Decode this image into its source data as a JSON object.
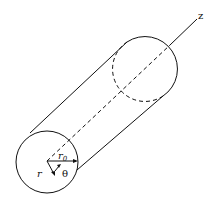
{
  "diagram": {
    "labels": {
      "axis": "z",
      "radius": "r",
      "radius_sub": "0",
      "r_coord": "r",
      "theta": "θ"
    },
    "colors": {
      "stroke": "#111111",
      "background": "#ffffff"
    }
  }
}
